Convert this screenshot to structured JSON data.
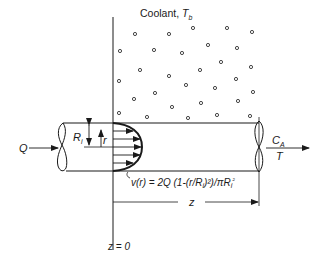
{
  "diagram": {
    "coolant_label": "Coolant, ",
    "coolant_temp_symbol": "T",
    "coolant_temp_subscript": "b",
    "inlet_flow_label": "Q",
    "radius_label": "R",
    "radius_subscript": "i",
    "radial_coord_label": "r",
    "outlet_conc_label": "C",
    "outlet_conc_subscript": "A",
    "outlet_temp_label": "T",
    "velocity_equation": "v(r) = 2Q (1-(r/R",
    "velocity_equation_tail": ")²)/πR",
    "velocity_equation_end": "²",
    "axial_length_label": "z",
    "origin_label": "z = 0",
    "colors": {
      "line": "#1a1a1a",
      "background": "#ffffff"
    },
    "coolant_particles": [
      [
        135,
        34
      ],
      [
        169,
        34
      ],
      [
        193,
        28
      ],
      [
        227,
        28
      ],
      [
        252,
        32
      ],
      [
        120,
        51
      ],
      [
        154,
        50
      ],
      [
        182,
        53
      ],
      [
        208,
        45
      ],
      [
        237,
        48
      ],
      [
        140,
        70
      ],
      [
        169,
        76
      ],
      [
        200,
        70
      ],
      [
        221,
        62
      ],
      [
        251,
        67
      ],
      [
        119,
        81
      ],
      [
        155,
        93
      ],
      [
        186,
        85
      ],
      [
        215,
        88
      ],
      [
        236,
        79
      ],
      [
        253,
        92
      ],
      [
        134,
        99
      ],
      [
        201,
        103
      ],
      [
        238,
        101
      ],
      [
        119,
        113
      ],
      [
        147,
        117
      ],
      [
        172,
        107
      ],
      [
        188,
        118
      ],
      [
        217,
        115
      ],
      [
        250,
        116
      ]
    ]
  }
}
